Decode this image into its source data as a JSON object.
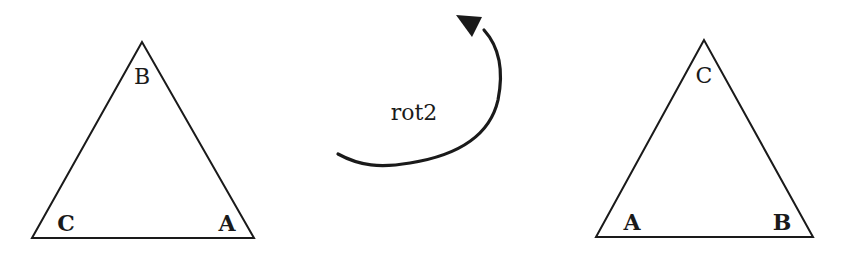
{
  "diagram": {
    "title": "",
    "before": {
      "vertices": {
        "top": "B",
        "bottom_left": "C",
        "bottom_right": "A"
      }
    },
    "transform": {
      "label": "rot2",
      "direction": "counter-clockwise",
      "icon": "curved-arrow-icon"
    },
    "after": {
      "vertices": {
        "top": "C",
        "bottom_left": "A",
        "bottom_right": "B"
      }
    },
    "colors": {
      "stroke": "#1a1a1a",
      "background": "#ffffff"
    }
  }
}
